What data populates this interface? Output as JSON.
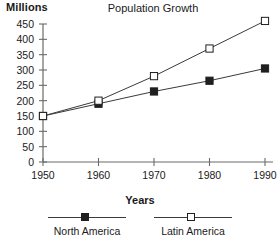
{
  "chart_data": {
    "type": "line",
    "title": "Population Growth",
    "xlabel": "Years",
    "ylabel": "Millions",
    "x": [
      1950,
      1960,
      1970,
      1980,
      1990
    ],
    "categories": [
      "1950",
      "1960",
      "1970",
      "1980",
      "1990"
    ],
    "xlim": [
      1950,
      1990
    ],
    "ylim": [
      0,
      450
    ],
    "y_ticks": [
      0,
      50,
      100,
      150,
      200,
      250,
      300,
      350,
      400,
      450
    ],
    "y_tick_labels": [
      "0",
      "50",
      "100",
      "150",
      "200",
      "250",
      "300",
      "350",
      "400",
      "450"
    ],
    "grid": false,
    "legend_position": "bottom",
    "series": [
      {
        "name": "North America",
        "marker": "filled-square",
        "color": "#1f1f1f",
        "values": [
          150,
          190,
          230,
          265,
          305
        ]
      },
      {
        "name": "Latin America",
        "marker": "open-square",
        "color": "#1f1f1f",
        "values": [
          150,
          200,
          280,
          370,
          460
        ]
      }
    ]
  },
  "legend": {
    "items": [
      {
        "label": "North America",
        "marker": "filled-square-icon"
      },
      {
        "label": "Latin America",
        "marker": "open-square-icon"
      }
    ]
  },
  "colors": {
    "axis": "#6b6b6b",
    "line": "#3a3a3a",
    "marker_stroke": "#1f1f1f",
    "marker_fill_solid": "#1f1f1f",
    "marker_fill_open": "#ffffff",
    "text": "#1a1a1a",
    "background": "#ffffff"
  }
}
